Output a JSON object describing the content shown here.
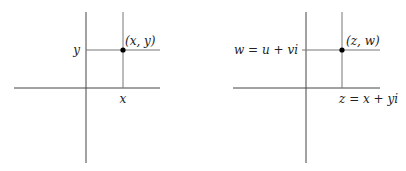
{
  "diagrams": [
    {
      "name": "real-plane",
      "y_label": "y",
      "x_label": "x",
      "point_label": "(x, y)"
    },
    {
      "name": "complex-pair-plane",
      "y_label": "w = u + vi",
      "x_label": "z = x + yi",
      "point_label": "(z, w)"
    }
  ],
  "colors": {
    "axis": "#444444",
    "guide": "#777777",
    "point": "#000000",
    "background": "#ffffff"
  }
}
